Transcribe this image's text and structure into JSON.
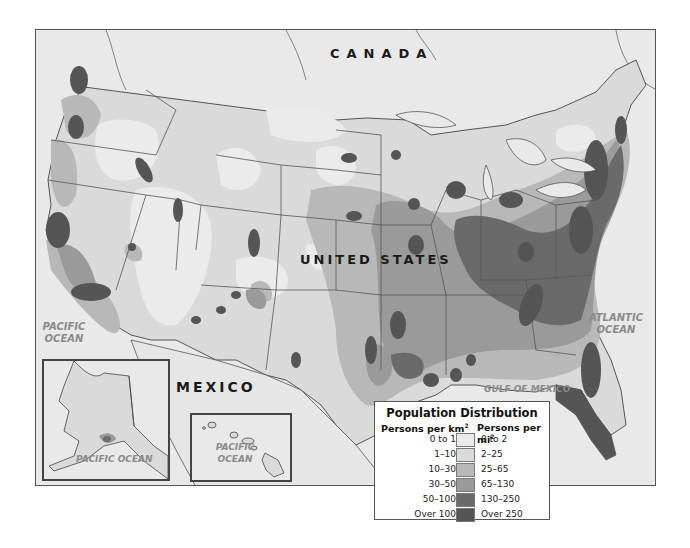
{
  "map": {
    "title": "Population Distribution",
    "labels": {
      "canada": "CANADA",
      "united_states": "UNITED STATES",
      "mexico": "MEXICO",
      "pacific_ocean_main_line1": "PACIFIC",
      "pacific_ocean_main_line2": "OCEAN",
      "atlantic_ocean_line1": "ATLANTIC",
      "atlantic_ocean_line2": "OCEAN",
      "gulf_of_mexico": "GULF OF MEXICO",
      "alaska_inset_ocean": "PACIFIC OCEAN",
      "hawaii_inset_ocean_line1": "PACIFIC",
      "hawaii_inset_ocean_line2": "OCEAN"
    },
    "colors": {
      "background": "#e6e6e6",
      "water": "#e9e9e9",
      "border_line": "#555555",
      "level_0": "#ebebeb",
      "level_1": "#dadada",
      "level_2": "#b8b8b8",
      "level_3": "#9a9a9a",
      "level_4": "#6a6a6a",
      "level_5": "#555555"
    }
  },
  "legend": {
    "title": "Population Distribution",
    "col_km_header": "Persons per km",
    "col_mi_header": "Persons per mi",
    "superscript": "2",
    "rows": [
      {
        "km": "0 to 1",
        "mi": "0 to 2",
        "color": "#ebebeb"
      },
      {
        "km": "1–10",
        "mi": "2–25",
        "color": "#dadada"
      },
      {
        "km": "10–30",
        "mi": "25–65",
        "color": "#b8b8b8"
      },
      {
        "km": "30–50",
        "mi": "65–130",
        "color": "#9a9a9a"
      },
      {
        "km": "50–100",
        "mi": "130–250",
        "color": "#6a6a6a"
      },
      {
        "km": "Over 100",
        "mi": "Over 250",
        "color": "#555555"
      }
    ]
  }
}
